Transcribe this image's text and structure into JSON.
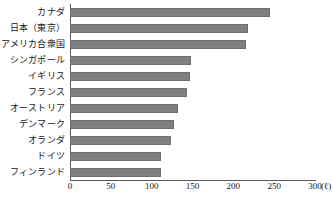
{
  "chart_data": {
    "type": "bar",
    "orientation": "horizontal",
    "title": "",
    "xlabel": "(ℓ)",
    "ylabel": "",
    "categories": [
      "カナダ",
      "日本（東京）",
      "アメリカ合衆国",
      "シンガポール",
      "イギリス",
      "フランス",
      "オーストリア",
      "デンマーク",
      "オランダ",
      "ドイツ",
      "フィンランド"
    ],
    "values": [
      245,
      218,
      215,
      148,
      147,
      143,
      132,
      127,
      124,
      111,
      111
    ],
    "xlim": [
      0,
      300
    ],
    "xticks": [
      0,
      50,
      100,
      150,
      200,
      250,
      300
    ],
    "xticklabels": [
      "0",
      "50",
      "100",
      "150",
      "200",
      "250",
      "300"
    ],
    "unit_suffix": "(ℓ)",
    "grid": false,
    "legend": null,
    "bar_color": "#808080",
    "bar_edge_color": "#6e6e6e",
    "axis_color": "#5a5a5a"
  }
}
